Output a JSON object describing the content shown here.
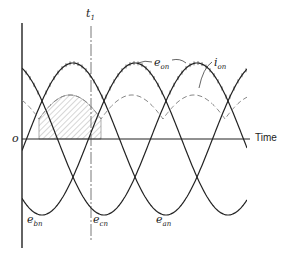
{
  "diagram": {
    "title": "",
    "axes": {
      "origin_label": "o",
      "x_label": "Time",
      "marker_label": {
        "base": "t",
        "sub": "1"
      }
    },
    "labels": {
      "e_on": {
        "base": "e",
        "sub": "on"
      },
      "i_on": {
        "base": "i",
        "sub": "on"
      },
      "e_an": {
        "base": "e",
        "sub": "an"
      },
      "e_bn": {
        "base": "e",
        "sub": "bn"
      },
      "e_cn": {
        "base": "e",
        "sub": "cn"
      }
    },
    "curves": [
      {
        "name": "e_an",
        "style": "solid",
        "description": "phase a-n voltage sinusoid"
      },
      {
        "name": "e_bn",
        "style": "solid",
        "description": "phase b-n voltage sinusoid"
      },
      {
        "name": "e_cn",
        "style": "solid",
        "description": "phase c-n voltage sinusoid"
      },
      {
        "name": "e_on",
        "style": "solid with tick marks",
        "description": "envelope of maximum phase voltage"
      },
      {
        "name": "i_on",
        "style": "dashed",
        "description": "output current"
      }
    ],
    "shaded_region": "hatched area under i_on between two commutation points, ending at t1",
    "colors": {
      "ink": "#222222",
      "dashed": "#888888",
      "hatch": "#999999",
      "background": "#ffffff"
    }
  }
}
